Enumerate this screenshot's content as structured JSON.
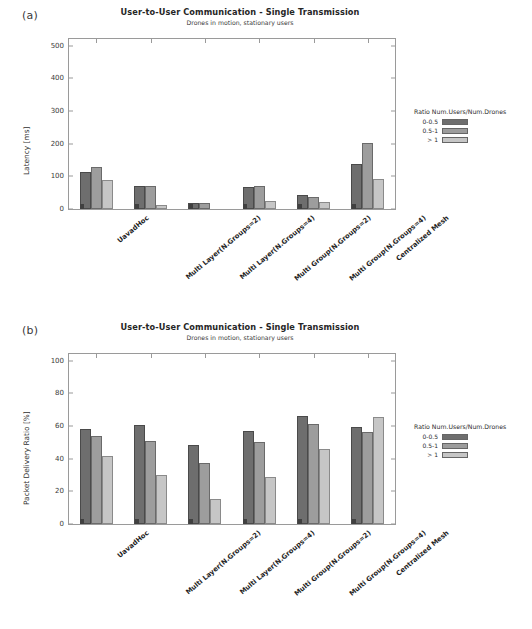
{
  "figure": {
    "panel_a_letter": "(a)",
    "panel_b_letter": "(b)",
    "footnote": ""
  },
  "chart_data": [
    {
      "panel": "(a)",
      "type": "bar",
      "title": "User-to-User Communication - Single Transmission",
      "subtitle": "Drones in motion, stationary users",
      "xlabel": "",
      "ylabel": "Latency [ms]",
      "ylim": [
        0,
        520
      ],
      "yticks": [
        0,
        100,
        200,
        300,
        400,
        500
      ],
      "grid": false,
      "legend_title": "Ratio Num.Users/Num.Drones",
      "legend_position": "right",
      "categories": [
        "UavadHoc",
        "Multi Layer(N.Groups=2)",
        "Multi Layer(N.Groups=4)",
        "Multi Group(N.Groups=2)",
        "Multi Group(N.Groups=4)",
        "Centralized Mesh"
      ],
      "series": [
        {
          "name": "0-0.5",
          "color": "#6e6e6e",
          "values": [
            112,
            70,
            18,
            66,
            42,
            137
          ]
        },
        {
          "name": "0.5-1",
          "color": "#9d9d9d",
          "values": [
            130,
            70,
            18,
            70,
            37,
            201
          ]
        },
        {
          "name": "> 1",
          "color": "#c6c6c6",
          "values": [
            90,
            12,
            0,
            25,
            21,
            92
          ]
        }
      ]
    },
    {
      "panel": "(b)",
      "type": "bar",
      "title": "User-to-User Communication - Single Transmission",
      "subtitle": "Drones in motion, stationary users",
      "xlabel": "",
      "ylabel": "Packet Delivery Ratio [%]",
      "ylim": [
        0,
        104
      ],
      "yticks": [
        0,
        20,
        40,
        60,
        80,
        100
      ],
      "grid": false,
      "legend_title": "Ratio Num.Users/Num.Drones",
      "legend_position": "right",
      "categories": [
        "UavadHoc",
        "Multi Layer(N.Groups=2)",
        "Multi Layer(N.Groups=4)",
        "Multi Group(N.Groups=2)",
        "Multi Group(N.Groups=4)",
        "Centralized Mesh"
      ],
      "series": [
        {
          "name": "0-0.5",
          "color": "#6e6e6e",
          "values": [
            58,
            60.5,
            48.5,
            57,
            66,
            59.5
          ]
        },
        {
          "name": "0.5-1",
          "color": "#9d9d9d",
          "values": [
            54,
            50.5,
            37.5,
            50,
            61,
            56.5
          ]
        },
        {
          "name": "> 1",
          "color": "#c6c6c6",
          "values": [
            41.5,
            30,
            15,
            29,
            46,
            65.5
          ]
        }
      ]
    }
  ]
}
